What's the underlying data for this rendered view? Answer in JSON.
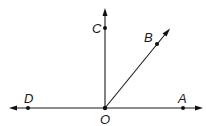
{
  "diagram": {
    "type": "geometry-rays",
    "points": {
      "O": {
        "label": "O",
        "x": 105,
        "y": 108
      },
      "A": {
        "label": "A",
        "x": 183,
        "y": 108
      },
      "B": {
        "label": "B",
        "x": 157,
        "y": 44
      },
      "C": {
        "label": "C",
        "x": 105,
        "y": 28
      },
      "D": {
        "label": "D",
        "x": 28,
        "y": 108
      }
    },
    "lines": [
      {
        "name": "line-DA",
        "from": "D",
        "to": "A",
        "arrows": "both"
      },
      {
        "name": "ray-OC",
        "from": "O",
        "to": "C",
        "arrows": "end"
      },
      {
        "name": "ray-OB",
        "from": "O",
        "to": "B",
        "arrows": "end"
      }
    ],
    "colors": {
      "stroke": "#1a1a1a",
      "background": "#ffffff"
    }
  }
}
